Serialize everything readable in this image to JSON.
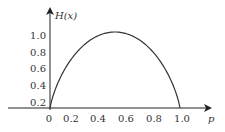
{
  "chart_data": {
    "type": "line",
    "title": "",
    "xlabel": "p",
    "ylabel": "H(x)",
    "x_ticks": [
      "0",
      "0.2",
      "0.4",
      "0.6",
      "0.8",
      "1.0"
    ],
    "y_ticks": [
      "0.2",
      "0.4",
      "0.6",
      "0.8",
      "1.0"
    ],
    "xlim": [
      0,
      1.0
    ],
    "ylim": [
      0,
      1.0
    ],
    "grid": false,
    "legend": null,
    "series": [
      {
        "name": "H(p) binary entropy",
        "x": [
          0,
          0.1,
          0.2,
          0.3,
          0.4,
          0.5,
          0.6,
          0.7,
          0.8,
          0.9,
          1.0
        ],
        "y": [
          0,
          0.47,
          0.72,
          0.88,
          0.97,
          1.0,
          0.97,
          0.88,
          0.72,
          0.47,
          0
        ]
      }
    ]
  }
}
